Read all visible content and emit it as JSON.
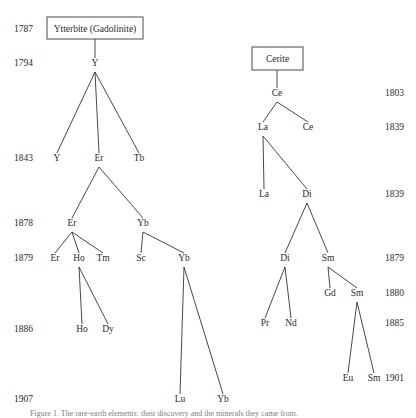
{
  "figure": {
    "caption": "Figure 1. The rare-earth elements: their discovery and the minerals they came from."
  },
  "source_boxes": [
    {
      "id": "ytterbite",
      "label": "Ytterbite (Gadolinite)",
      "x": 47,
      "y": 17,
      "w": 96,
      "h": 22
    },
    {
      "id": "cerite",
      "label": "Cerite",
      "x": 252,
      "y": 47,
      "w": 51,
      "h": 23
    }
  ],
  "year_labels_left": [
    {
      "text": "1787",
      "x": 14,
      "y": 32
    },
    {
      "text": "1794",
      "x": 14,
      "y": 66
    },
    {
      "text": "1843",
      "x": 14,
      "y": 161
    },
    {
      "text": "1878",
      "x": 14,
      "y": 226
    },
    {
      "text": "1879",
      "x": 14,
      "y": 261
    },
    {
      "text": "1886",
      "x": 14,
      "y": 332
    },
    {
      "text": "1907",
      "x": 14,
      "y": 402
    }
  ],
  "year_labels_right": [
    {
      "text": "1803",
      "x": 385,
      "y": 96
    },
    {
      "text": "1839",
      "x": 385,
      "y": 130
    },
    {
      "text": "1839",
      "x": 385,
      "y": 197
    },
    {
      "text": "1879",
      "x": 385,
      "y": 261
    },
    {
      "text": "1880",
      "x": 385,
      "y": 296
    },
    {
      "text": "1885",
      "x": 385,
      "y": 326
    },
    {
      "text": "1901",
      "x": 385,
      "y": 381
    }
  ],
  "nodes": [
    {
      "id": "n-y-1794",
      "label": "Y",
      "x": 95,
      "y": 66,
      "year": "1794",
      "tree": "ytterbite"
    },
    {
      "id": "n-y-1843",
      "label": "Y",
      "x": 57,
      "y": 161,
      "year": "1843",
      "tree": "ytterbite"
    },
    {
      "id": "n-er-1843",
      "label": "Er",
      "x": 99,
      "y": 161,
      "year": "1843",
      "tree": "ytterbite"
    },
    {
      "id": "n-tb-1843",
      "label": "Tb",
      "x": 139,
      "y": 161,
      "year": "1843",
      "tree": "ytterbite"
    },
    {
      "id": "n-er-1878",
      "label": "Er",
      "x": 72,
      "y": 226,
      "year": "1878",
      "tree": "ytterbite"
    },
    {
      "id": "n-yb-1878",
      "label": "Yb",
      "x": 143,
      "y": 226,
      "year": "1878",
      "tree": "ytterbite"
    },
    {
      "id": "n-er-1879",
      "label": "Er",
      "x": 55,
      "y": 261,
      "year": "1879",
      "tree": "ytterbite"
    },
    {
      "id": "n-ho-1879",
      "label": "Ho",
      "x": 79,
      "y": 261,
      "year": "1879",
      "tree": "ytterbite"
    },
    {
      "id": "n-tm-1879",
      "label": "Tm",
      "x": 103,
      "y": 261,
      "year": "1879",
      "tree": "ytterbite"
    },
    {
      "id": "n-sc-1879",
      "label": "Sc",
      "x": 141,
      "y": 261,
      "year": "1879",
      "tree": "ytterbite"
    },
    {
      "id": "n-yb-1879",
      "label": "Yb",
      "x": 184,
      "y": 261,
      "year": "1879",
      "tree": "ytterbite"
    },
    {
      "id": "n-ho-1886",
      "label": "Ho",
      "x": 82,
      "y": 332,
      "year": "1886",
      "tree": "ytterbite"
    },
    {
      "id": "n-dy-1886",
      "label": "Dy",
      "x": 108,
      "y": 332,
      "year": "1886",
      "tree": "ytterbite"
    },
    {
      "id": "n-lu-1907",
      "label": "Lu",
      "x": 180,
      "y": 402,
      "year": "1907",
      "tree": "ytterbite"
    },
    {
      "id": "n-yb-1907",
      "label": "Yb",
      "x": 223,
      "y": 402,
      "year": "1907",
      "tree": "ytterbite"
    },
    {
      "id": "n-ce-1803",
      "label": "Ce",
      "x": 277,
      "y": 96,
      "year": "1803",
      "tree": "cerite"
    },
    {
      "id": "n-la-1839",
      "label": "La",
      "x": 263,
      "y": 130,
      "year": "1839",
      "tree": "cerite"
    },
    {
      "id": "n-ce-1839",
      "label": "Ce",
      "x": 308,
      "y": 130,
      "year": "1839",
      "tree": "cerite"
    },
    {
      "id": "n-la-1839b",
      "label": "La",
      "x": 264,
      "y": 197,
      "year": "1839",
      "tree": "cerite"
    },
    {
      "id": "n-di-1839",
      "label": "Di",
      "x": 307,
      "y": 197,
      "year": "1839",
      "tree": "cerite"
    },
    {
      "id": "n-di-1879",
      "label": "Di",
      "x": 285,
      "y": 261,
      "year": "1879",
      "tree": "cerite"
    },
    {
      "id": "n-sm-1879",
      "label": "Sm",
      "x": 328,
      "y": 261,
      "year": "1879",
      "tree": "cerite"
    },
    {
      "id": "n-gd-1880",
      "label": "Gd",
      "x": 330,
      "y": 296,
      "year": "1880",
      "tree": "cerite"
    },
    {
      "id": "n-sm-1880",
      "label": "Sm",
      "x": 357,
      "y": 296,
      "year": "1880",
      "tree": "cerite"
    },
    {
      "id": "n-pr-1885",
      "label": "Pr",
      "x": 265,
      "y": 326,
      "year": "1885",
      "tree": "cerite"
    },
    {
      "id": "n-nd-1885",
      "label": "Nd",
      "x": 291,
      "y": 326,
      "year": "1885",
      "tree": "cerite"
    },
    {
      "id": "n-eu-1901",
      "label": "Eu",
      "x": 348,
      "y": 381,
      "year": "1901",
      "tree": "cerite"
    },
    {
      "id": "n-sm-1901",
      "label": "Sm",
      "x": 374,
      "y": 381,
      "year": "1901",
      "tree": "cerite"
    }
  ],
  "edges": [
    {
      "id": "e-box-y",
      "x1": 95,
      "y1": 39,
      "x2": 95,
      "y2": 58
    },
    {
      "id": "e-y-y",
      "x1": 95,
      "y1": 72,
      "x2": 57,
      "y2": 153
    },
    {
      "id": "e-y-er",
      "x1": 95,
      "y1": 72,
      "x2": 99,
      "y2": 153
    },
    {
      "id": "e-y-tb",
      "x1": 95,
      "y1": 72,
      "x2": 139,
      "y2": 153
    },
    {
      "id": "e-er-er",
      "x1": 99,
      "y1": 167,
      "x2": 72,
      "y2": 218
    },
    {
      "id": "e-er-yb",
      "x1": 99,
      "y1": 167,
      "x2": 143,
      "y2": 218
    },
    {
      "id": "e-er78-er79",
      "x1": 72,
      "y1": 232,
      "x2": 55,
      "y2": 253
    },
    {
      "id": "e-er78-ho79",
      "x1": 72,
      "y1": 232,
      "x2": 79,
      "y2": 253
    },
    {
      "id": "e-er78-tm79",
      "x1": 72,
      "y1": 232,
      "x2": 103,
      "y2": 253
    },
    {
      "id": "e-yb78-sc79",
      "x1": 143,
      "y1": 232,
      "x2": 141,
      "y2": 253
    },
    {
      "id": "e-yb78-yb79",
      "x1": 143,
      "y1": 232,
      "x2": 184,
      "y2": 253
    },
    {
      "id": "e-ho79-ho86",
      "x1": 79,
      "y1": 267,
      "x2": 82,
      "y2": 324
    },
    {
      "id": "e-ho79-dy86",
      "x1": 79,
      "y1": 267,
      "x2": 108,
      "y2": 324
    },
    {
      "id": "e-yb79-lu07",
      "x1": 184,
      "y1": 267,
      "x2": 180,
      "y2": 394
    },
    {
      "id": "e-yb79-yb07",
      "x1": 184,
      "y1": 267,
      "x2": 223,
      "y2": 394
    },
    {
      "id": "e-cerite-ce",
      "x1": 277,
      "y1": 70,
      "x2": 277,
      "y2": 88
    },
    {
      "id": "e-ce-la",
      "x1": 277,
      "y1": 102,
      "x2": 263,
      "y2": 122
    },
    {
      "id": "e-ce-ce",
      "x1": 277,
      "y1": 102,
      "x2": 308,
      "y2": 122
    },
    {
      "id": "e-la-la",
      "x1": 263,
      "y1": 136,
      "x2": 264,
      "y2": 189
    },
    {
      "id": "e-la-di",
      "x1": 263,
      "y1": 136,
      "x2": 307,
      "y2": 189
    },
    {
      "id": "e-di-di",
      "x1": 307,
      "y1": 203,
      "x2": 285,
      "y2": 253
    },
    {
      "id": "e-di-sm",
      "x1": 307,
      "y1": 203,
      "x2": 328,
      "y2": 253
    },
    {
      "id": "e-di79-pr",
      "x1": 285,
      "y1": 267,
      "x2": 265,
      "y2": 318
    },
    {
      "id": "e-di79-nd",
      "x1": 285,
      "y1": 267,
      "x2": 291,
      "y2": 318
    },
    {
      "id": "e-sm79-gd",
      "x1": 328,
      "y1": 267,
      "x2": 330,
      "y2": 288
    },
    {
      "id": "e-sm79-sm80",
      "x1": 328,
      "y1": 267,
      "x2": 357,
      "y2": 288
    },
    {
      "id": "e-sm80-eu",
      "x1": 357,
      "y1": 302,
      "x2": 348,
      "y2": 373
    },
    {
      "id": "e-sm80-sm01",
      "x1": 357,
      "y1": 302,
      "x2": 374,
      "y2": 373
    }
  ]
}
